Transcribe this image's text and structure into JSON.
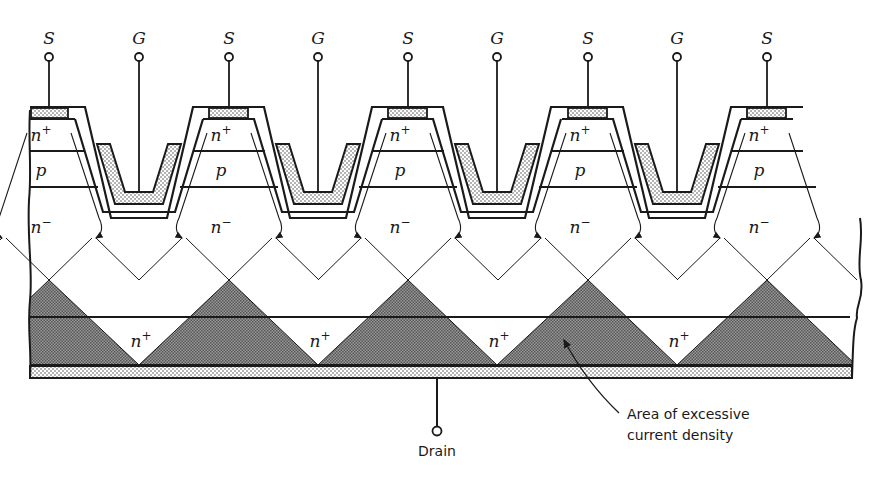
{
  "figure": {
    "terminals": [
      {
        "label": "S",
        "type": "source",
        "x": 49
      },
      {
        "label": "G",
        "type": "gate",
        "x": 139
      },
      {
        "label": "S",
        "type": "source",
        "x": 229
      },
      {
        "label": "G",
        "type": "gate",
        "x": 318
      },
      {
        "label": "S",
        "type": "source",
        "x": 408
      },
      {
        "label": "G",
        "type": "gate",
        "x": 497
      },
      {
        "label": "S",
        "type": "source",
        "x": 588
      },
      {
        "label": "G",
        "type": "gate",
        "x": 677
      },
      {
        "label": "S",
        "type": "source",
        "x": 767
      }
    ],
    "cell_regions": {
      "source_region": {
        "base": "n",
        "sup": "+"
      },
      "body_region": {
        "base": "p",
        "sup": ""
      },
      "drift_region": {
        "base": "n",
        "sup": "−"
      },
      "substrate_region": {
        "base": "n",
        "sup": "+"
      }
    },
    "drain": {
      "label": "Drain"
    },
    "annotation": {
      "line1": "Area of excessive",
      "line2": "current density"
    },
    "colors": {
      "ink": "#1a1a1a",
      "dense_fill": "#8a8a8a",
      "light_fill": "#d8d8d8",
      "background": "#ffffff"
    }
  }
}
